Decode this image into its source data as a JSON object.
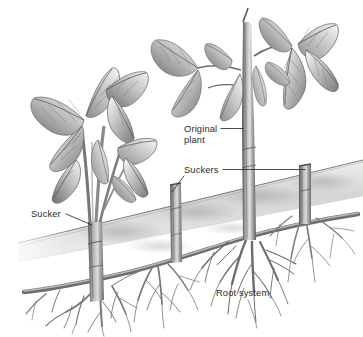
{
  "figure": {
    "style": "grayscale pencil illustration",
    "background_color": "#ffffff",
    "ink_color": "#2b2b2b",
    "width": 363,
    "height": 337
  },
  "labels": {
    "original_plant_line1": "Original",
    "original_plant_line2": "plant",
    "suckers": "Suckers",
    "sucker": "Sucker",
    "root_system": "Root system"
  },
  "soil": {
    "band_fill_light": "#e6e6e6",
    "band_fill_mid": "#cfcfcf",
    "band_fill_dark": "#b4b4b4",
    "surface_line_color": "#6f6f6f"
  },
  "plant_colors": {
    "leaf_light": "#f2f2f2",
    "leaf_mid": "#b8b8b8",
    "leaf_dark": "#6e6e6e",
    "vein": "#5a5a5a",
    "stem_light": "#cbcbcb",
    "stem_mid": "#9a9a9a",
    "stem_dark": "#5c5c5c",
    "root_color": "#7a7a7a",
    "root_dark": "#555555"
  },
  "parts": {
    "left_plant": "sucker shoot with foliage at left",
    "original_plant": "tall central cane with foliage",
    "sucker_middle": "short sucker stub left of centre",
    "sucker_right": "short sucker stub at right edge",
    "rhizome": "horizontal underground root running left to right",
    "roots": "fibrous root system hanging below rhizome"
  }
}
